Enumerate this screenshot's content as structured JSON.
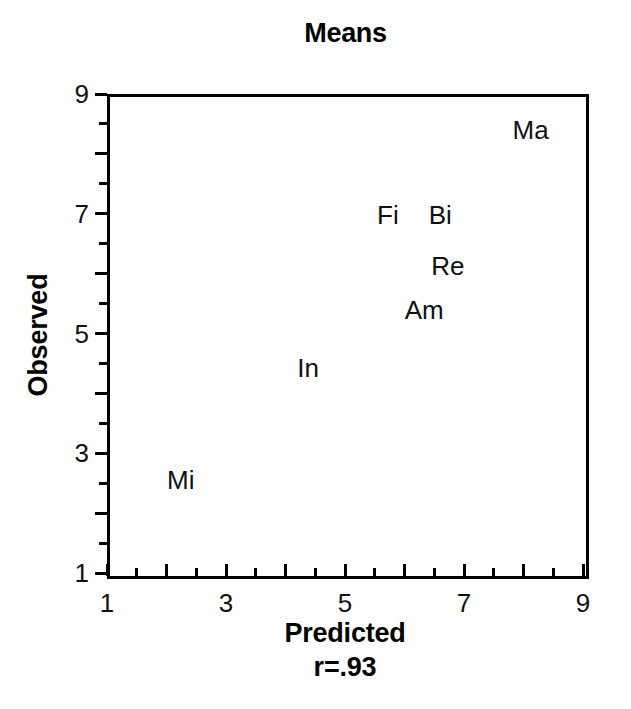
{
  "chart_data": {
    "type": "scatter",
    "title": "Means",
    "xlabel": "Predicted",
    "ylabel": "Observed",
    "annotation": "r=.93",
    "xlim": [
      1,
      9
    ],
    "ylim": [
      1,
      9
    ],
    "xticks": [
      1,
      3,
      5,
      7,
      9
    ],
    "xtick_labels": [
      "1",
      "3",
      "5",
      "7",
      "9"
    ],
    "yticks": [
      1,
      3,
      5,
      7,
      9
    ],
    "ytick_labels": [
      "1",
      "3",
      "5",
      "7",
      "9"
    ],
    "minor_tick_step": 0.5,
    "y_minor_tick_step": 0.5,
    "grid": false,
    "legend": "none",
    "marker_style": "text-label",
    "points": [
      {
        "label": "Ma",
        "x": 8.07,
        "y": 8.45
      },
      {
        "label": "Fi",
        "x": 5.67,
        "y": 7.03
      },
      {
        "label": "Bi",
        "x": 6.55,
        "y": 7.03
      },
      {
        "label": "Re",
        "x": 6.68,
        "y": 6.18
      },
      {
        "label": "Am",
        "x": 6.28,
        "y": 5.44
      },
      {
        "label": "In",
        "x": 4.33,
        "y": 4.47
      },
      {
        "label": "Mi",
        "x": 2.19,
        "y": 2.6
      }
    ]
  },
  "colors": {
    "background": "#ffffff",
    "foreground": "#000000",
    "text": "#111111"
  }
}
